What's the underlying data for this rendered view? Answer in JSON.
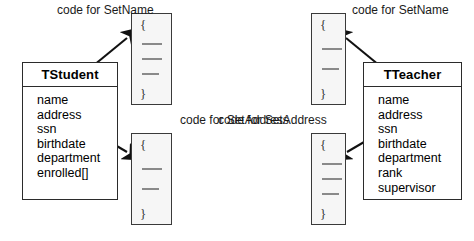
{
  "diagram": {
    "background_color": "#ffffff",
    "line_color": "#2b2b2b"
  },
  "classes": [
    {
      "id": "tstudent",
      "name": "TStudent",
      "attributes": [
        "name",
        "address",
        "ssn",
        "birthdate",
        "department",
        "enrolled[]"
      ]
    },
    {
      "id": "tteacher",
      "name": "TTeacher",
      "attributes": [
        "name",
        "address",
        "ssn",
        "birthdate",
        "department",
        "rank",
        "supervisor"
      ]
    }
  ],
  "captions": {
    "student_setname": "code for SetName",
    "student_setaddress": "code for SetAddress",
    "teacher_setname": "code for SetName",
    "teacher_setaddress": "code for SetAddress"
  },
  "code_blocks": [
    {
      "id": "student-setname-code",
      "for_class": "TStudent",
      "method": "SetName",
      "open_brace": "{",
      "close_brace": "}",
      "statement_count": 3
    },
    {
      "id": "student-setaddress-code",
      "for_class": "TStudent",
      "method": "SetAddress",
      "open_brace": "{",
      "close_brace": "}",
      "statement_count": 2
    },
    {
      "id": "teacher-setname-code",
      "for_class": "TTeacher",
      "method": "SetName",
      "open_brace": "{",
      "close_brace": "}",
      "statement_count": 2
    },
    {
      "id": "teacher-setaddress-code",
      "for_class": "TTeacher",
      "method": "SetAddress",
      "open_brace": "{",
      "close_brace": "}",
      "statement_count": 3
    }
  ]
}
